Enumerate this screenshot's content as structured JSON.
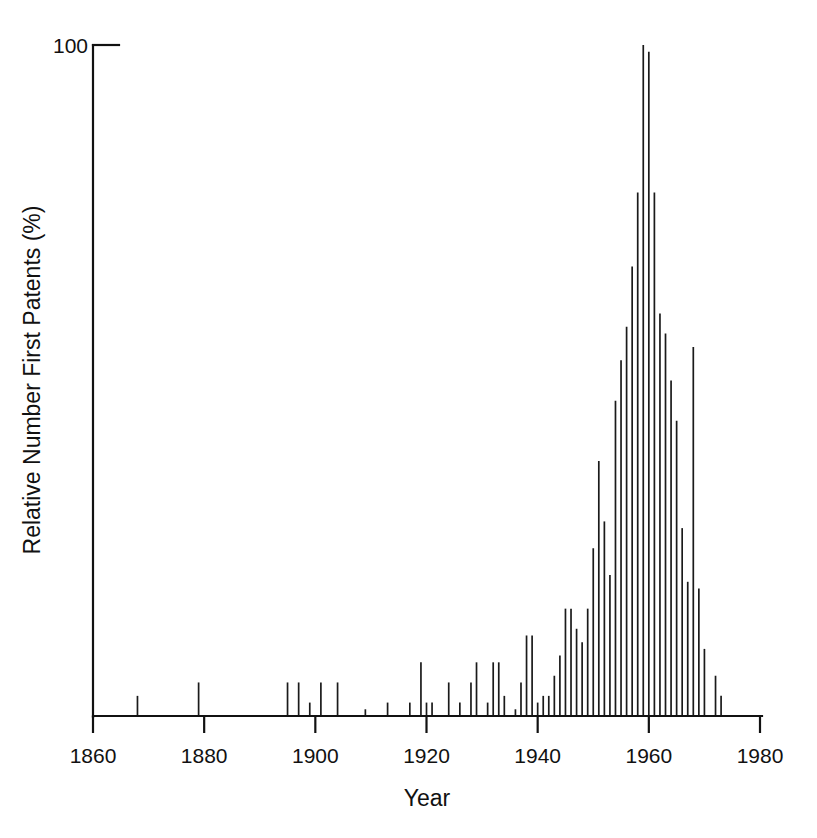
{
  "chart_data": {
    "type": "bar",
    "title": "",
    "subtitle": "",
    "xlabel": "Year",
    "ylabel": "Relative Number First Patents (%)",
    "xlim": [
      1860,
      1980
    ],
    "ylim": [
      0,
      100
    ],
    "xticks": [
      1860,
      1880,
      1900,
      1920,
      1940,
      1960,
      1980
    ],
    "xtick_labels": [
      "1860",
      "1880",
      "1900",
      "1920",
      "1940",
      "1960",
      "1980"
    ],
    "yticks": [
      100
    ],
    "ytick_labels": [
      "100"
    ],
    "grid": false,
    "legend": null,
    "series_color": "#1a1a1a",
    "bar_style": "thin-vertical-line",
    "annotations": [],
    "x": [
      1868,
      1879,
      1895,
      1897,
      1899,
      1901,
      1904,
      1909,
      1913,
      1917,
      1919,
      1920,
      1921,
      1924,
      1926,
      1928,
      1929,
      1931,
      1932,
      1933,
      1934,
      1936,
      1937,
      1938,
      1939,
      1940,
      1941,
      1942,
      1943,
      1944,
      1945,
      1946,
      1947,
      1948,
      1949,
      1950,
      1951,
      1952,
      1953,
      1954,
      1955,
      1956,
      1957,
      1958,
      1959,
      1960,
      1961,
      1962,
      1963,
      1964,
      1965,
      1966,
      1967,
      1968,
      1969,
      1970,
      1972,
      1973
    ],
    "values": [
      3,
      5,
      5,
      5,
      2,
      5,
      5,
      1,
      2,
      2,
      8,
      2,
      2,
      5,
      2,
      5,
      8,
      2,
      8,
      8,
      3,
      1,
      5,
      12,
      12,
      2,
      3,
      3,
      6,
      9,
      16,
      16,
      13,
      11,
      16,
      25,
      38,
      29,
      21,
      47,
      53,
      58,
      67,
      78,
      100,
      99,
      78,
      60,
      57,
      50,
      44,
      28,
      20,
      55,
      19,
      10,
      6,
      3
    ],
    "series": [
      {
        "name": "Relative Number First Patents",
        "values": [
          3,
          5,
          5,
          5,
          2,
          5,
          5,
          1,
          2,
          2,
          8,
          2,
          2,
          5,
          2,
          5,
          8,
          2,
          8,
          8,
          3,
          1,
          5,
          12,
          12,
          2,
          3,
          3,
          6,
          9,
          16,
          16,
          13,
          11,
          16,
          25,
          38,
          29,
          21,
          47,
          53,
          58,
          67,
          78,
          100,
          99,
          78,
          60,
          57,
          50,
          44,
          28,
          20,
          55,
          19,
          10,
          6,
          3
        ]
      }
    ]
  },
  "figure": {
    "axis_color": "#111111",
    "background": "#ffffff"
  }
}
